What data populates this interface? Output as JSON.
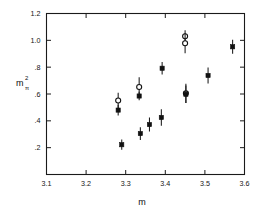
{
  "chart_data": {
    "type": "scatter",
    "title": "",
    "xlabel": "m",
    "ylabel": "mπ²",
    "ylabel_base": "m",
    "ylabel_sub": "π",
    "ylabel_sup": "2",
    "xlim": [
      3.1,
      3.6
    ],
    "ylim": [
      0.0,
      1.2
    ],
    "xticks": [
      3.1,
      3.2,
      3.3,
      3.4,
      3.5,
      3.6
    ],
    "xticklabels": [
      "3.1",
      "3.2",
      "3.3",
      "3.4",
      "3.5",
      "3.6"
    ],
    "yticks": [
      0.2,
      0.4,
      0.6,
      0.8,
      1.0,
      1.2
    ],
    "yticklabels": [
      ".2",
      ".4",
      ".6",
      ".8",
      "1.0",
      "1.2"
    ],
    "grid": false,
    "legend": "none",
    "errorbars": "vertical",
    "series": [
      {
        "name": "open-circle",
        "marker": "circle-open",
        "points": [
          {
            "x": 3.281,
            "y": 0.552,
            "yerr": 0.058
          },
          {
            "x": 3.334,
            "y": 0.652,
            "yerr": 0.072
          },
          {
            "x": 3.45,
            "y": 1.03,
            "yerr": 0.045
          },
          {
            "x": 3.45,
            "y": 0.978,
            "yerr": 0.075
          },
          {
            "x": 3.452,
            "y": 0.605,
            "yerr": 0.072
          }
        ]
      },
      {
        "name": "filled-square",
        "marker": "square-filled",
        "points": [
          {
            "x": 3.281,
            "y": 0.48,
            "yerr": 0.04
          },
          {
            "x": 3.29,
            "y": 0.222,
            "yerr": 0.038
          },
          {
            "x": 3.334,
            "y": 0.585,
            "yerr": 0.032
          },
          {
            "x": 3.337,
            "y": 0.305,
            "yerr": 0.047
          },
          {
            "x": 3.36,
            "y": 0.372,
            "yerr": 0.052
          },
          {
            "x": 3.39,
            "y": 0.425,
            "yerr": 0.062
          },
          {
            "x": 3.392,
            "y": 0.792,
            "yerr": 0.047
          },
          {
            "x": 3.452,
            "y": 0.598,
            "yerr": 0.065
          },
          {
            "x": 3.508,
            "y": 0.738,
            "yerr": 0.06
          },
          {
            "x": 3.57,
            "y": 0.952,
            "yerr": 0.052
          }
        ]
      }
    ]
  }
}
